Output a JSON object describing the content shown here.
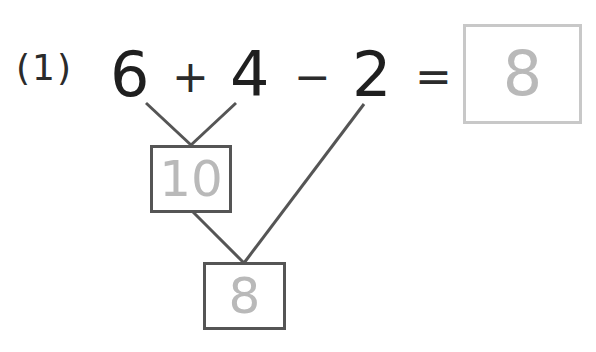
{
  "problem": {
    "label": "(1)",
    "operands": [
      "6",
      "4",
      "2"
    ],
    "operators": [
      "+",
      "−",
      "="
    ],
    "final_answer": "8"
  },
  "tree": {
    "intermediate_result": "10",
    "final_result": "8"
  },
  "colors": {
    "text": "#1f1f1f",
    "lines": "#555555",
    "answer_text": "#b9b9b9",
    "answer_box_border": "#c8c8c8"
  }
}
